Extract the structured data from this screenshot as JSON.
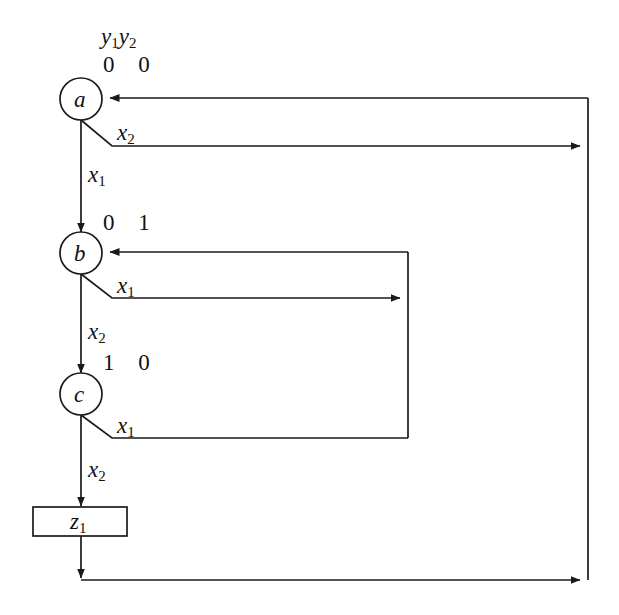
{
  "figure": {
    "type": "state-transition-diagram",
    "background_color": "#ffffff",
    "line_color": "#1a1a1a",
    "text_color": "#111111"
  },
  "header": {
    "output_vars": "y",
    "output_var_sub_1": "1",
    "output_var_2": "y",
    "output_var_sub_2": "2"
  },
  "states": [
    {
      "id": "a",
      "name": "a",
      "outputs": "0 0",
      "cx": 81,
      "cy": 99,
      "r": 21
    },
    {
      "id": "b",
      "name": "b",
      "outputs": "0 1",
      "cx": 81,
      "cy": 253,
      "r": 21
    },
    {
      "id": "c",
      "name": "c",
      "outputs": "1 0",
      "cx": 81,
      "cy": 394,
      "r": 21
    }
  ],
  "output_box": {
    "label": "z",
    "label_sub": "1",
    "x": 33,
    "y": 507,
    "width": 94,
    "height": 29
  },
  "transitions": [
    {
      "from": "a",
      "to": "b",
      "condition": "x",
      "condition_sub": "1",
      "label_x": 88,
      "label_y": 163
    },
    {
      "from": "a",
      "to": "a",
      "condition": "x",
      "condition_sub": "2",
      "label_x": 117,
      "label_y": 121
    },
    {
      "from": "b",
      "to": "c",
      "condition": "x",
      "condition_sub": "2",
      "label_x": 88,
      "label_y": 320
    },
    {
      "from": "b",
      "to": "b",
      "condition": "x",
      "condition_sub": "1",
      "label_x": 117,
      "label_y": 274
    },
    {
      "from": "c",
      "to": "output",
      "condition": "x",
      "condition_sub": "2",
      "label_x": 88,
      "label_y": 458
    },
    {
      "from": "c",
      "to": "b",
      "condition": "x",
      "condition_sub": "1",
      "label_x": 117,
      "label_y": 414
    }
  ],
  "buses": {
    "middle_bus_x": 408,
    "right_bus_x": 588,
    "top_return_y": 98,
    "bottom_return_y": 580
  }
}
